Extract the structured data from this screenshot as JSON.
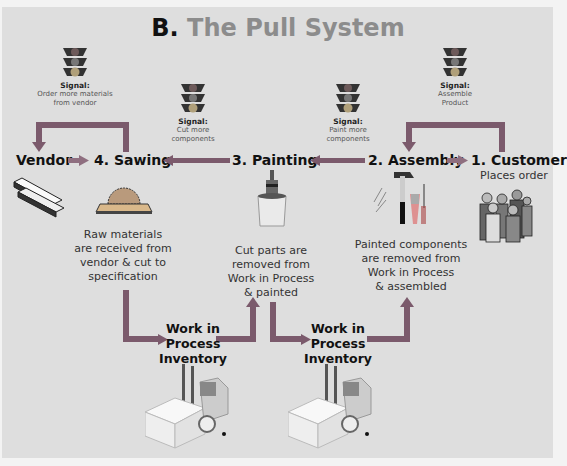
{
  "title": {
    "prefix": "B.",
    "text": "The Pull System"
  },
  "colors": {
    "background": "#dedede",
    "arrow": "#7b5a6c",
    "title_gray": "#8c8c8c",
    "text": "#111111"
  },
  "nodes": {
    "vendor": "Vendor",
    "sawing": "4. Sawing",
    "painting": "3. Painting",
    "assembly": "2. Assembly",
    "customer": "1. Customer",
    "customer_sub": "Places order"
  },
  "signals": [
    {
      "label": "Signal:",
      "text1": "Order more materials",
      "text2": "from vendor"
    },
    {
      "label": "Signal:",
      "text1": "Cut more",
      "text2": "components"
    },
    {
      "label": "Signal:",
      "text1": "Paint more",
      "text2": "components"
    },
    {
      "label": "Signal:",
      "text1": "Assemble",
      "text2": "Product"
    }
  ],
  "descriptions": {
    "sawing": [
      "Raw materials",
      "are received from",
      "vendor & cut to",
      "specification"
    ],
    "painting": [
      "Cut parts are",
      "removed from",
      "Work in Process",
      "& painted"
    ],
    "assembly": [
      "Painted components",
      "are removed from",
      "Work in Process",
      "& assembled"
    ]
  },
  "wip": [
    {
      "l1": "Work in",
      "l2": "Process",
      "l3": "Inventory"
    },
    {
      "l1": "Work in",
      "l2": "Process",
      "l3": "Inventory"
    }
  ],
  "icons": [
    "traffic-light-icon",
    "lumber-icon",
    "saw-icon",
    "paint-bucket-icon",
    "tools-icon",
    "customers-icon",
    "forklift-icon"
  ]
}
